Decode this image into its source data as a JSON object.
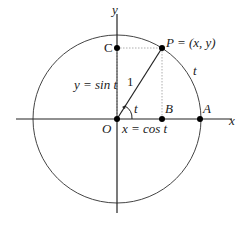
{
  "diagram": {
    "type": "unit-circle",
    "axes": {
      "x_label": "x",
      "y_label": "y"
    },
    "points": {
      "origin": "O",
      "P": "P = (x, y)",
      "A": "A",
      "B": "B",
      "C": "C"
    },
    "labels": {
      "radius": "1",
      "angle": "t",
      "arc": "t",
      "sine": "y = sin t",
      "cosine": "x = cos t"
    },
    "colors": {
      "stroke": "#333333",
      "guide": "#888888",
      "dot": "#000000"
    }
  }
}
